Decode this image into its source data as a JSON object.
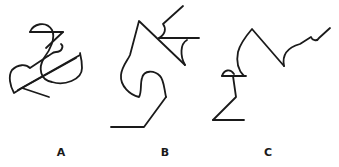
{
  "figures": [
    {
      "id": "A",
      "label": "A",
      "description": "tangled line drawing with heart loop, diagonal, and semicircle"
    },
    {
      "id": "B",
      "label": "B",
      "description": "line drawing with peak, crossing horizontal, S-curve and base line"
    },
    {
      "id": "C",
      "label": "C",
      "description": "line drawing with peak, small hump, and wavy rising tail"
    }
  ],
  "colors": {
    "stroke": "#1a1a1a",
    "background": "#ffffff"
  }
}
